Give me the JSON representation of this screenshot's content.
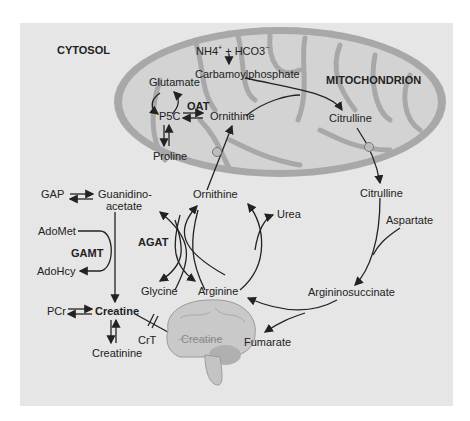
{
  "regions": {
    "cytosol": "CYTOSOL",
    "mitochondrion": "MITOCHONDRION"
  },
  "mitochondrion_labels": {
    "nh4": "NH4",
    "nh4_sup": "+",
    "plus": "+",
    "hco3": "HCO3",
    "hco3_sup": "−",
    "carbamoylphosphate": "Carbamoylphosphate",
    "glutamate": "Glutamate",
    "p5c": "P5C",
    "oat": "OAT",
    "ornithine": "Ornithine",
    "proline": "Proline",
    "citrulline": "Citrulline"
  },
  "cytosol_labels": {
    "gap": "GAP",
    "guanidinoacetate_1": "Guanidino-",
    "guanidinoacetate_2": "acetate",
    "ornithine": "Ornithine",
    "citrulline": "Citrulline",
    "urea": "Urea",
    "aspartate": "Aspartate",
    "adomet": "AdoMet",
    "gamt": "GAMT",
    "adohcy": "AdoHcy",
    "agat": "AGAT",
    "glycine": "Glycine",
    "arginine": "Arginine",
    "argininosuccinate": "Argininosuccinate",
    "pcr": "PCr",
    "creatine": "Creatine",
    "creatinine": "Creatinine",
    "crt": "CrT",
    "fumarate": "Fumarate",
    "brain_creatine": "Creatine"
  },
  "colors": {
    "panel": "#e6e6e6",
    "mito_outer": "#a9a9a9",
    "mito_inner": "#d4d4d4",
    "text": "#222222"
  }
}
